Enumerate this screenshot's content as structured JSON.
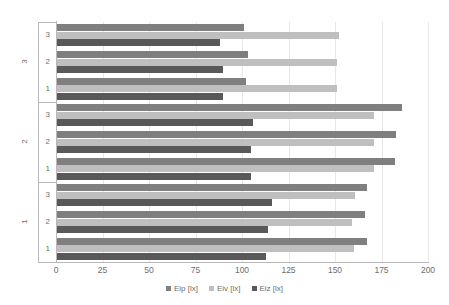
{
  "chart_data": {
    "type": "bar",
    "orientation": "horizontal",
    "title": "",
    "xlabel": "",
    "ylabel": "",
    "xlim": [
      0,
      200
    ],
    "xticks": [
      0,
      25,
      50,
      75,
      100,
      125,
      150,
      175,
      200
    ],
    "grid": true,
    "legend_position": "bottom",
    "group_labels": [
      "1",
      "2",
      "3"
    ],
    "categories": [
      "1",
      "2",
      "3"
    ],
    "series": [
      {
        "name": "Eip [lx]",
        "color": "#7f7f7f"
      },
      {
        "name": "Eiv [lx]",
        "color": "#bfbfbf"
      },
      {
        "name": "Eiz [lx]",
        "color": "#595959"
      }
    ],
    "groups": [
      {
        "group": "3",
        "rows": [
          {
            "category": "3",
            "Eip": 101,
            "Eiv": 152,
            "Eiz": 88
          },
          {
            "category": "2",
            "Eip": 103,
            "Eiv": 151,
            "Eiz": 90
          },
          {
            "category": "1",
            "Eip": 102,
            "Eiv": 151,
            "Eiz": 90
          }
        ]
      },
      {
        "group": "2",
        "rows": [
          {
            "category": "3",
            "Eip": 186,
            "Eiv": 171,
            "Eiz": 106
          },
          {
            "category": "2",
            "Eip": 183,
            "Eiv": 171,
            "Eiz": 105
          },
          {
            "category": "1",
            "Eip": 182,
            "Eiv": 171,
            "Eiz": 105
          }
        ]
      },
      {
        "group": "1",
        "rows": [
          {
            "category": "3",
            "Eip": 167,
            "Eiv": 161,
            "Eiz": 116
          },
          {
            "category": "2",
            "Eip": 166,
            "Eiv": 159,
            "Eiz": 114
          },
          {
            "category": "1",
            "Eip": 167,
            "Eiv": 160,
            "Eiz": 113
          }
        ]
      }
    ]
  },
  "axis": {
    "x_tick_labels": [
      "0",
      "25",
      "50",
      "75",
      "100",
      "125",
      "150",
      "175",
      "200"
    ],
    "y_group_labels": [
      "3",
      "2",
      "1"
    ],
    "y_category_labels": [
      "3",
      "2",
      "1"
    ]
  },
  "legend": {
    "items": [
      {
        "label": "Eip [lx]",
        "color": "#7f7f7f"
      },
      {
        "label": "Eiv [lx]",
        "color": "#bfbfbf"
      },
      {
        "label": "Eiz [lx]",
        "color": "#595959"
      }
    ]
  },
  "colors": {
    "eip": "#7f7f7f",
    "eiv": "#bfbfbf",
    "eiz": "#595959",
    "grid": "#e8e8e8",
    "axis": "#b8b8b8",
    "text": "#6e6e6e",
    "background": "#ffffff"
  }
}
